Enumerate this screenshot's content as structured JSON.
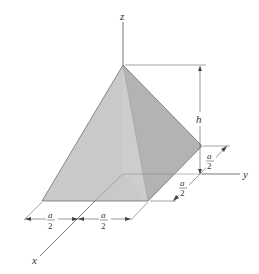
{
  "figure": {
    "type": "pyramid-isometric",
    "axes": {
      "x": "x",
      "y": "y",
      "z": "z"
    },
    "height_label": "h",
    "dims": [
      {
        "num": "a",
        "den": "2"
      },
      {
        "num": "a",
        "den": "2"
      },
      {
        "num": "a",
        "den": "2"
      },
      {
        "num": "a",
        "den": "2"
      }
    ],
    "colors": {
      "front_face": "#c9c9c9",
      "right_face": "#b3b3b3",
      "inner_face": "#d4d4d4",
      "base": "#d8d8d8",
      "edge": "#6e6e6e",
      "line": "#555555"
    }
  }
}
